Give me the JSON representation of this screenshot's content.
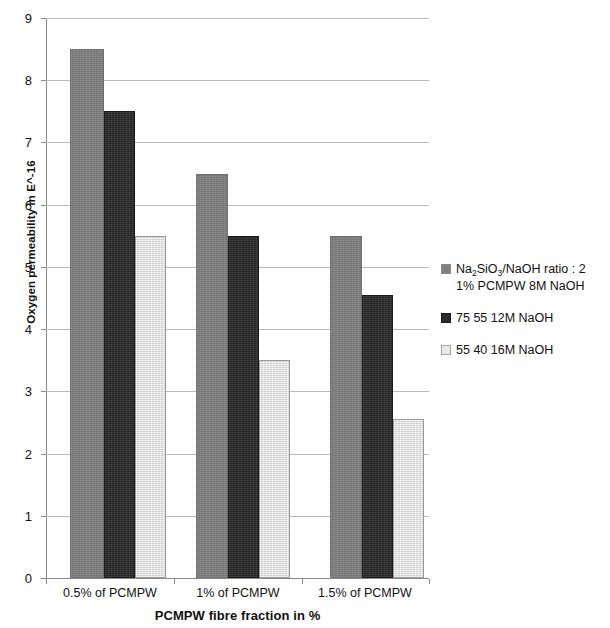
{
  "chart_data": {
    "type": "bar",
    "title": "",
    "xlabel": "PCMPW fibre fraction in %",
    "ylabel": "Oxygen permeability in E^-16",
    "categories": [
      "0.5% of PCMPW",
      "1% of PCMPW",
      "1.5% of PCMPW"
    ],
    "series": [
      {
        "name": "Na2SiO3/NaOH ratio : 2  1% PCMPW 8M NaOH",
        "legend_line1": "Na",
        "legend_sub1": "2",
        "legend_mid": "SiO",
        "legend_sub2": "3",
        "legend_tail": "/NaOH ratio : 2",
        "legend_line2": "1% PCMPW 8M NaOH",
        "color": "#808080",
        "values": [
          8.5,
          6.5,
          5.5
        ]
      },
      {
        "name": "75 55 12M NaOH",
        "color": "#2b2b2b",
        "values": [
          7.5,
          5.5,
          4.55
        ]
      },
      {
        "name": "55 40 16M NaOH",
        "color": "#e8e8e8",
        "values": [
          5.5,
          3.5,
          2.55
        ]
      }
    ],
    "ylim": [
      0,
      9
    ],
    "ytick_labels": [
      "9",
      "8",
      "7",
      "6",
      "5",
      "4",
      "3",
      "2",
      "1",
      "0"
    ],
    "ytick_values": [
      9,
      8,
      7,
      6,
      5,
      4,
      3,
      2,
      1,
      0
    ],
    "grid": true,
    "legend_position": "right"
  }
}
